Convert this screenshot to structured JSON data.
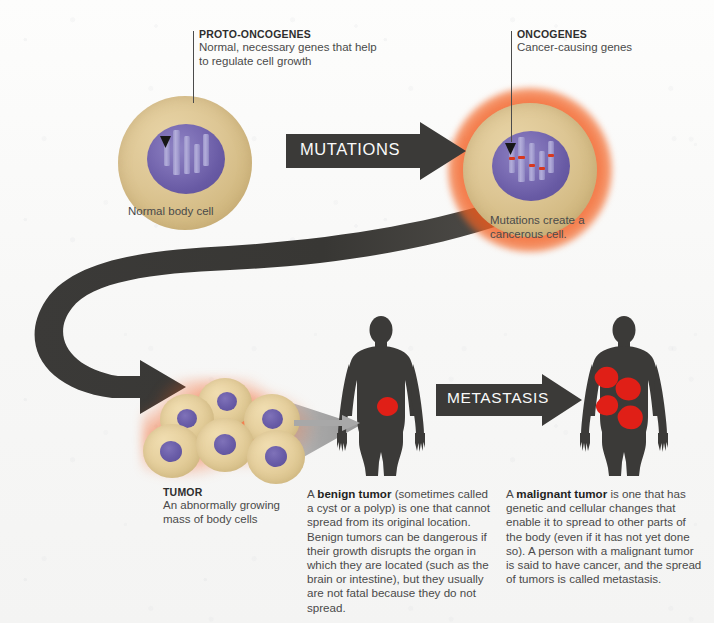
{
  "diagram": {
    "background_color": "#fbfbfa"
  },
  "callouts": {
    "proto_oncogenes": {
      "heading": "PROTO-ONCOGENES",
      "body": "Normal, necessary genes that help to regulate cell growth"
    },
    "oncogenes": {
      "heading": "ONCOGENES",
      "body": "Cancer-causing genes"
    },
    "tumor": {
      "heading": "TUMOR",
      "body": "An abnormally growing mass of body cells"
    }
  },
  "captions": {
    "normal_cell": "Normal body cell",
    "cancerous_cell": "Mutations create a cancerous cell."
  },
  "arrows": {
    "mutations_label": "MUTATIONS",
    "metastasis_label": "METASTASIS"
  },
  "paragraphs": {
    "benign": {
      "lead": "A ",
      "bold": "benign tumor",
      "rest": " (sometimes called a cyst or a polyp) is one that cannot spread from its original location. Benign tumors can be dangerous if their growth disrupts the organ in which they are located (such as the brain or intestine), but they usually are not fatal because they do not spread."
    },
    "malignant": {
      "lead": "A ",
      "bold": "malignant tumor",
      "rest": " is one that has genetic and cellular changes that enable it to spread to other parts of the body (even if it has not yet done so). A person with a malignant tumor is said to have cancer, and the spread of tumors is called metastasis."
    }
  },
  "colors": {
    "cell_cytoplasm": "#ddc694",
    "nucleus_purple": "#6a5da8",
    "chromosome": "#a9a3d2",
    "mutation_band_red": "#d8381f",
    "cancer_glow_orange": "#f25a1c",
    "arrow_dark": "#3b3a38",
    "body_silhouette": "#3b3a38",
    "tumor_red": "#e01f17",
    "cone_gray": "#9b9b9b",
    "text_body": "#4a4a4a",
    "text_heading": "#2e2e2e"
  },
  "figures": {
    "normal_cell_chromosome_count": 5,
    "cancer_cell_chromosome_count": 5,
    "cancer_cell_mutation_bands": 5,
    "tumor_cluster_cell_count": 6,
    "benign_body_tumor_count": 1,
    "malignant_body_tumor_count": 4
  }
}
